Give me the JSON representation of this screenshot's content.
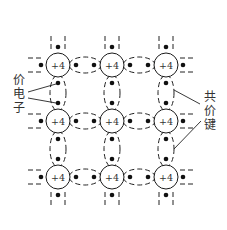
{
  "diagram": {
    "atom_charge_label": "+4",
    "grid": {
      "columns_x": [
        58,
        112,
        166
      ],
      "rows_y": [
        65,
        121,
        177
      ],
      "atom_radius": 12
    },
    "labels": {
      "valence_electron": [
        "价",
        "电",
        "子"
      ],
      "covalent_bond": [
        "共",
        "价",
        "键"
      ]
    },
    "atoms": [
      {
        "row": 1,
        "col": 1,
        "label": "+4"
      },
      {
        "row": 1,
        "col": 2,
        "label": "+4"
      },
      {
        "row": 1,
        "col": 3,
        "label": "+4"
      },
      {
        "row": 2,
        "col": 1,
        "label": "+4"
      },
      {
        "row": 2,
        "col": 2,
        "label": "+4"
      },
      {
        "row": 2,
        "col": 3,
        "label": "+4"
      },
      {
        "row": 3,
        "col": 1,
        "label": "+4"
      },
      {
        "row": 3,
        "col": 2,
        "label": "+4"
      },
      {
        "row": 3,
        "col": 3,
        "label": "+4"
      }
    ],
    "colors": {
      "line": "#222222",
      "electron": "#111111",
      "text": "#333333",
      "background": "#ffffff"
    }
  }
}
